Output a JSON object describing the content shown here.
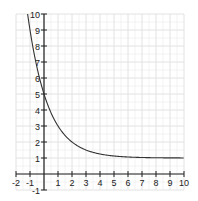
{
  "chart_data": {
    "type": "line",
    "title": "",
    "xlabel": "",
    "ylabel": "",
    "xlim": [
      -2,
      10
    ],
    "ylim": [
      -1,
      10
    ],
    "grid": true,
    "x_ticks": [
      "-2",
      "-1",
      "1",
      "2",
      "3",
      "4",
      "5",
      "6",
      "7",
      "8",
      "9",
      "10"
    ],
    "y_ticks": [
      "-1",
      "1",
      "2",
      "3",
      "4",
      "5",
      "6",
      "7",
      "8",
      "9",
      "10"
    ],
    "function": "y = 1 + 4 * 0.5^x",
    "series": [
      {
        "name": "f(x)",
        "x": [
          -1.15,
          -1,
          0,
          1,
          2,
          3,
          4,
          5,
          6,
          7,
          8,
          9,
          10
        ],
        "y": [
          10,
          9,
          5,
          3,
          2,
          1.5,
          1.25,
          1.13,
          1.06,
          1.03,
          1.02,
          1.01,
          1.0
        ]
      }
    ],
    "colors": {
      "curve": "#333333",
      "axis": "#222222",
      "grid": "#e2e2e2"
    }
  }
}
